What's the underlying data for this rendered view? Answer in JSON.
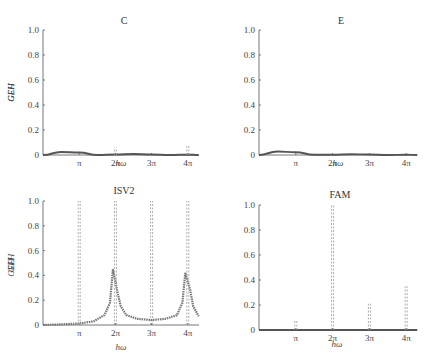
{
  "chart_data": [
    {
      "type": "line",
      "title": "C",
      "xlabel": "hω",
      "ylabel": "GEH",
      "ylim": [
        0,
        1.0
      ],
      "yticks": [
        "0",
        "0.2",
        "0.4",
        "0.6",
        "0.8",
        "1.0"
      ],
      "xticks": [
        "π",
        "2π",
        "3π",
        "4π"
      ],
      "grid": false,
      "series": [
        {
          "name": "GEH",
          "style": "solid",
          "x": [
            0,
            0.5,
            1.0,
            1.5,
            2.0,
            2.5,
            3.0,
            3.5,
            4.0,
            4.3
          ],
          "values": [
            0,
            0.025,
            0.02,
            0.0,
            0.005,
            0.008,
            0.005,
            0.0,
            0.003,
            0.0
          ]
        },
        {
          "name": "peaks",
          "style": "dashed",
          "x": [
            2.0,
            4.0
          ],
          "values": [
            0.06,
            0.08
          ]
        }
      ]
    },
    {
      "type": "line",
      "title": "E",
      "xlabel": "hω",
      "ylabel": "GEH",
      "ylim": [
        0,
        1.0
      ],
      "yticks": [
        "0",
        "0.2",
        "0.4",
        "0.6",
        "0.8",
        "1.0"
      ],
      "xticks": [
        "π",
        "2π",
        "3π",
        "4π"
      ],
      "grid": false,
      "series": [
        {
          "name": "GEH",
          "style": "solid",
          "x": [
            0,
            0.5,
            1.0,
            1.5,
            2.0,
            2.5,
            3.0,
            3.5,
            4.0,
            4.3
          ],
          "values": [
            0,
            0.028,
            0.022,
            0.002,
            0.003,
            0.006,
            0.004,
            0.0,
            0.002,
            0.0
          ]
        }
      ]
    },
    {
      "type": "line",
      "title": "ISV2",
      "xlabel": "hω",
      "ylabel": "GEH",
      "ylim": [
        0,
        1.0
      ],
      "yticks": [
        "0",
        "0.2",
        "0.4",
        "0.6",
        "0.8",
        "1.0"
      ],
      "xticks": [
        "π",
        "2π",
        "3π",
        "4π"
      ],
      "grid": false,
      "series": [
        {
          "name": "GEH",
          "style": "dotted",
          "x": [
            0,
            0.5,
            1.0,
            1.4,
            1.7,
            1.85,
            1.93,
            2.07,
            2.15,
            2.3,
            2.6,
            3.0,
            3.4,
            3.7,
            3.85,
            3.93,
            4.07,
            4.15,
            4.3
          ],
          "values": [
            0,
            0.005,
            0.012,
            0.03,
            0.08,
            0.18,
            0.45,
            0.25,
            0.15,
            0.08,
            0.05,
            0.04,
            0.05,
            0.08,
            0.18,
            0.42,
            0.28,
            0.15,
            0.07
          ]
        },
        {
          "name": "asymptotes",
          "style": "dashed",
          "x": [
            1.0,
            2.0,
            3.0,
            4.0
          ],
          "values": [
            1.0,
            1.0,
            1.0,
            1.0
          ]
        }
      ]
    },
    {
      "type": "line",
      "title": "FAM",
      "xlabel": "hω",
      "ylabel": "GEH",
      "ylim": [
        0,
        1.0
      ],
      "yticks": [
        "0",
        "0.2",
        "0.4",
        "0.6",
        "0.8",
        "1.0"
      ],
      "xticks": [
        "π",
        "2π",
        "3π",
        "4π"
      ],
      "grid": false,
      "series": [
        {
          "name": "GEH",
          "style": "solid",
          "x": [
            0,
            4.3
          ],
          "values": [
            0,
            0
          ]
        },
        {
          "name": "peaks",
          "style": "dashed",
          "x": [
            1.0,
            2.0,
            3.0,
            4.0
          ],
          "values": [
            0.08,
            1.0,
            0.21,
            0.35
          ]
        }
      ]
    }
  ]
}
